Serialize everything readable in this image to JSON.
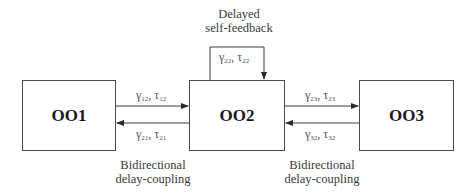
{
  "nodes": [
    {
      "id": "OO1",
      "label": "OO1"
    },
    {
      "id": "OO2",
      "label": "OO2"
    },
    {
      "id": "OO3",
      "label": "OO3"
    }
  ],
  "self_feedback": {
    "title_line1": "Delayed",
    "title_line2": "self-feedback",
    "gamma": "γ",
    "gamma_sub": "22",
    "tau": "τ",
    "tau_sub": "22"
  },
  "links": [
    {
      "from": "OO1",
      "to": "OO2",
      "gamma": "γ",
      "gamma_sub": "12",
      "tau": "τ",
      "tau_sub": "12"
    },
    {
      "from": "OO2",
      "to": "OO1",
      "gamma": "γ",
      "gamma_sub": "21",
      "tau": "τ",
      "tau_sub": "21"
    },
    {
      "from": "OO2",
      "to": "OO3",
      "gamma": "γ",
      "gamma_sub": "23",
      "tau": "τ",
      "tau_sub": "23"
    },
    {
      "from": "OO3",
      "to": "OO2",
      "gamma": "γ",
      "gamma_sub": "32",
      "tau": "τ",
      "tau_sub": "32"
    }
  ],
  "coupling_labels": [
    {
      "line1": "Bidirectional",
      "line2": "delay-coupling"
    },
    {
      "line1": "Bidirectional",
      "line2": "delay-coupling"
    }
  ],
  "separator": ", ",
  "colors": {
    "line": "#3a3a3a",
    "text": "#2a2a2a"
  }
}
